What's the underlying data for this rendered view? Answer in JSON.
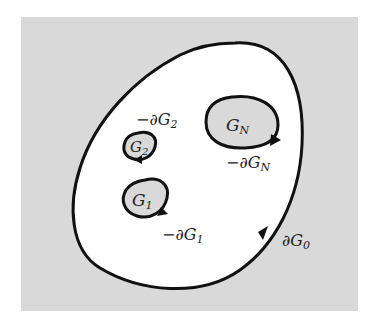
{
  "diagram": {
    "background_color": "#d9d9d9",
    "region_fill": "#ffffff",
    "stroke_color": "#111111",
    "regions": [
      {
        "id": "G0",
        "label": "",
        "boundary_label": "∂G",
        "boundary_sub": "0",
        "boundary_prefix": ""
      },
      {
        "id": "G1",
        "label": "G",
        "label_sub": "1",
        "boundary_label": "∂G",
        "boundary_sub": "1",
        "boundary_prefix": "−"
      },
      {
        "id": "G2",
        "label": "G",
        "label_sub": "2",
        "boundary_label": "∂G",
        "boundary_sub": "2",
        "boundary_prefix": "−"
      },
      {
        "id": "GN",
        "label": "G",
        "label_sub": "N",
        "boundary_label": "∂G",
        "boundary_sub": "N",
        "boundary_prefix": "−"
      }
    ]
  }
}
